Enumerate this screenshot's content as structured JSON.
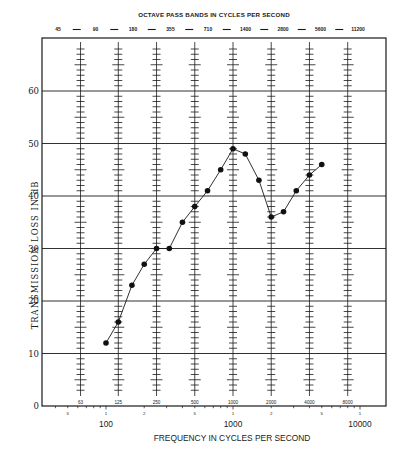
{
  "chart_data": {
    "type": "line",
    "title": "OCTAVE PASS BANDS IN CYCLES PER SECOND",
    "xlabel": "FREQUENCY IN CYCLES PER SECOND",
    "ylabel": "TRANSMISSION LOSS IN dB",
    "x_scale": "log",
    "xlim": [
      35,
      14500
    ],
    "ylim": [
      0,
      70
    ],
    "grid": true,
    "legend": null,
    "y_ticks": [
      0,
      10,
      20,
      30,
      40,
      50,
      60
    ],
    "x_major_labels": [
      {
        "value": 100,
        "label": "100"
      },
      {
        "value": 1000,
        "label": "1000"
      },
      {
        "value": 10000,
        "label": "10000"
      }
    ],
    "x_minor_labels": [
      {
        "value": 50,
        "label": "5"
      },
      {
        "value": 100,
        "label": "1"
      },
      {
        "value": 200,
        "label": "2"
      },
      {
        "value": 500,
        "label": "5"
      },
      {
        "value": 1000,
        "label": "1"
      },
      {
        "value": 2000,
        "label": "2"
      },
      {
        "value": 5000,
        "label": "5"
      },
      {
        "value": 10000,
        "label": "1"
      }
    ],
    "octave_band_edges": [
      "45",
      "90",
      "180",
      "355",
      "710",
      "1400",
      "2800",
      "5600",
      "11200"
    ],
    "octave_band_centers": [
      {
        "value": 63,
        "label": "63"
      },
      {
        "value": 125,
        "label": "125"
      },
      {
        "value": 250,
        "label": "250"
      },
      {
        "value": 500,
        "label": "500"
      },
      {
        "value": 1000,
        "label": "1000"
      },
      {
        "value": 2000,
        "label": "2000"
      },
      {
        "value": 4000,
        "label": "4000"
      },
      {
        "value": 8000,
        "label": "8000"
      }
    ],
    "series": [
      {
        "name": "Transmission loss",
        "marker": "filled-circle",
        "color": "#111111",
        "x": [
          100,
          125,
          160,
          200,
          250,
          315,
          400,
          500,
          630,
          800,
          1000,
          1250,
          1600,
          2000,
          2500,
          3150,
          4000,
          5000
        ],
        "values": [
          12,
          16,
          23,
          27,
          30,
          30,
          35,
          38,
          41,
          45,
          49,
          48,
          43,
          36,
          37,
          41,
          44,
          46
        ]
      }
    ]
  },
  "colors": {
    "ink": "#1a1a1a",
    "grid": "#2a2a2a",
    "background": "#ffffff"
  }
}
